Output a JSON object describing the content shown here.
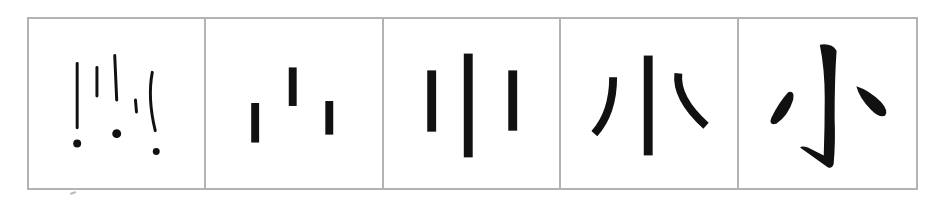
{
  "diagram": {
    "border_color": "#b3b3b3",
    "ink_color": "#111111",
    "panels": [
      {
        "stage": 1,
        "style": "hand-drawn strokes with dots"
      },
      {
        "stage": 2,
        "style": "three short bars"
      },
      {
        "stage": 3,
        "style": "three vertical bars, tall center"
      },
      {
        "stage": 4,
        "style": "center bar with curved side strokes"
      },
      {
        "stage": 5,
        "style": "calligraphic character with hook"
      }
    ]
  }
}
